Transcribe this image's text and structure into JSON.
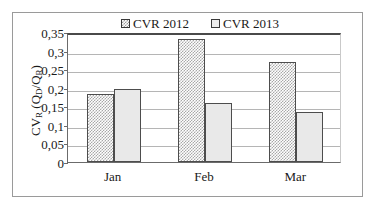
{
  "chart_data": {
    "type": "bar",
    "title": "",
    "subtitle": "",
    "categories": [
      "Jan",
      "Feb",
      "Mar"
    ],
    "series": [
      {
        "name": "CVR 2012",
        "values": [
          0.182,
          0.331,
          0.27
        ],
        "swatch": "checkered",
        "color": "#a8a8a8"
      },
      {
        "name": "CVR 2013",
        "values": [
          0.197,
          0.158,
          0.135
        ],
        "swatch": "plain",
        "color": "#e9e9e9"
      }
    ],
    "xlabel": "",
    "ylabel": "CVR (QD/QR)",
    "ylabel_parts": {
      "main": "CV",
      "main_sub": "R",
      "paren_open": " (Q",
      "num_sub": "D",
      "slash": "/Q",
      "den_sub": "R",
      "paren_close": ")"
    },
    "ylim": [
      0,
      0.35
    ],
    "ytick_values": [
      0,
      0.05,
      0.1,
      0.15,
      0.2,
      0.25,
      0.3,
      0.35
    ],
    "ytick_labels": [
      "0",
      "0,05",
      "0,1",
      "0,15",
      "0,2",
      "0,25",
      "0,3",
      "0,35"
    ],
    "decimal_separator": ",",
    "grid": true,
    "grid_axis": "y",
    "legend_position": "top-center",
    "legend": [
      "CVR 2012",
      "CVR 2013"
    ],
    "frame": true,
    "colors": {
      "axis": "#6b6b6b",
      "grid": "#b5b5b5",
      "bar_border": "#4d4d4d",
      "series_2012_hatch": "#a8a8a8",
      "series_2013_fill": "#e9e9e9",
      "outer_frame": "#9a9a9a",
      "text": "#1a1a1a"
    }
  }
}
